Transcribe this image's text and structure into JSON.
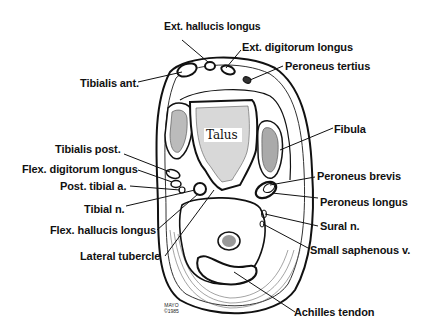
{
  "diagram": {
    "center_label": "Talus",
    "labels_left": [
      {
        "id": "ext-hallucis-longus",
        "text": "Ext. hallucis longus"
      },
      {
        "id": "tibialis-ant",
        "text": "Tibialis ant."
      },
      {
        "id": "tibialis-post",
        "text": "Tibialis post."
      },
      {
        "id": "flex-digitorum-longus",
        "text": "Flex. digitorum longus"
      },
      {
        "id": "post-tibial-a",
        "text": "Post. tibial a."
      },
      {
        "id": "tibial-n",
        "text": "Tibial n."
      },
      {
        "id": "flex-hallucis-longus",
        "text": "Flex. hallucis longus"
      },
      {
        "id": "lateral-tubercle",
        "text": "Lateral tubercle"
      }
    ],
    "labels_right": [
      {
        "id": "ext-digitorum-longus",
        "text": "Ext. digitorum longus"
      },
      {
        "id": "peroneus-tertius",
        "text": "Peroneus tertius"
      },
      {
        "id": "fibula",
        "text": "Fibula"
      },
      {
        "id": "peroneus-brevis",
        "text": "Peroneus brevis"
      },
      {
        "id": "peroneus-longus",
        "text": "Peroneus longus"
      },
      {
        "id": "sural-n",
        "text": "Sural n."
      },
      {
        "id": "small-saphenous-v",
        "text": "Small saphenous v."
      },
      {
        "id": "achilles-tendon",
        "text": "Achilles tendon"
      }
    ],
    "credit": {
      "line1": "MAYO",
      "line2": "©1985"
    }
  }
}
